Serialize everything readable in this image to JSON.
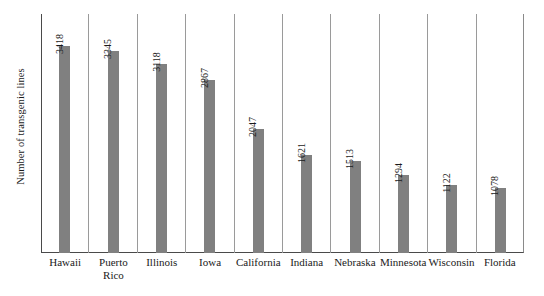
{
  "chart_data": {
    "type": "bar",
    "title": "",
    "subtitle": "",
    "xlabel": "",
    "ylabel": "Number of transgenic lines",
    "categories": [
      "Hawaii",
      "Puerto\nRico",
      "Illinois",
      "Iowa",
      "California",
      "Indiana",
      "Nebraska",
      "Minnesota",
      "Wisconsin",
      "Florida"
    ],
    "values": [
      3418,
      3345,
      3118,
      2867,
      2047,
      1621,
      1513,
      1294,
      1122,
      1078
    ],
    "value_labels": [
      "3418",
      "3345",
      "3118",
      "2867",
      "2047",
      "1621",
      "1513",
      "1294",
      "1122",
      "1078"
    ],
    "ylim": [
      0,
      3950
    ],
    "grid": "vertical-category-separators",
    "legend": "none",
    "bar_color": "#808080",
    "axis_color": "#4a4a4a",
    "gridline_color": "#9a9a9a",
    "background_color": "#ffffff",
    "annotations": "Rotated value label above each bar; rotated y-axis title on left."
  }
}
